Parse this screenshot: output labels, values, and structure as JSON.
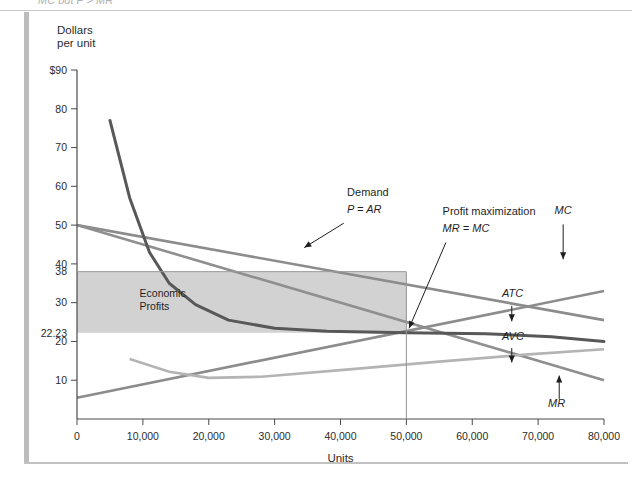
{
  "page": {
    "clipped_header_text": "MC but P > MR"
  },
  "chart_data": {
    "type": "line",
    "title": "",
    "ylabel_line1": "Dollars",
    "ylabel_line2": "per unit",
    "xlabel": "Units",
    "xlim": [
      0,
      80000
    ],
    "ylim": [
      0,
      90
    ],
    "grid": false,
    "legend_position": "inline-annotations",
    "x_ticks": [
      "0",
      "10,000",
      "20,000",
      "30,000",
      "40,000",
      "50,000",
      "60,000",
      "70,000",
      "80,000"
    ],
    "x_tick_values": [
      0,
      10000,
      20000,
      30000,
      40000,
      50000,
      60000,
      70000,
      80000
    ],
    "y_ticks": [
      "$90",
      "80",
      "70",
      "60",
      "50",
      "40",
      "38",
      "30",
      "22.23",
      "20",
      "10"
    ],
    "y_tick_values": [
      90,
      80,
      70,
      60,
      50,
      40,
      38,
      30,
      22.23,
      20,
      10
    ],
    "series": [
      {
        "name": "Demand (P = AR)",
        "label": "Demand",
        "label2": "P = AR",
        "color": "#8c8c8c",
        "points": [
          [
            0,
            50
          ],
          [
            80000,
            25.5
          ]
        ]
      },
      {
        "name": "MR",
        "label": "MR",
        "color": "#8f8f8f",
        "points": [
          [
            0,
            50
          ],
          [
            80000,
            10
          ]
        ]
      },
      {
        "name": "ATC",
        "label": "ATC",
        "color": "#585858",
        "points": [
          [
            5000,
            77
          ],
          [
            8000,
            57
          ],
          [
            11000,
            43
          ],
          [
            14000,
            35
          ],
          [
            18000,
            29.5
          ],
          [
            23000,
            25.5
          ],
          [
            30000,
            23.4
          ],
          [
            38000,
            22.6
          ],
          [
            50000,
            22.23
          ],
          [
            62000,
            22.0
          ],
          [
            72000,
            21.2
          ],
          [
            80000,
            20.0
          ]
        ]
      },
      {
        "name": "MC",
        "label": "MC",
        "color": "#8c8c8c",
        "points": [
          [
            0,
            5.5
          ],
          [
            80000,
            33
          ]
        ]
      },
      {
        "name": "AVC",
        "label": "AVC",
        "color": "#b4b4b4",
        "points": [
          [
            8000,
            15.5
          ],
          [
            14000,
            12.2
          ],
          [
            20000,
            10.6
          ],
          [
            28000,
            10.9
          ],
          [
            40000,
            12.6
          ],
          [
            55000,
            14.8
          ],
          [
            68000,
            16.6
          ],
          [
            80000,
            18.0
          ]
        ]
      }
    ],
    "shaded_region": {
      "label_line1": "Economic",
      "label_line2": "Profits",
      "x_from": 0,
      "x_to": 50000,
      "y_from": 22.23,
      "y_to": 38,
      "color": "#d2d2d2"
    },
    "annotations": [
      {
        "name": "profit-maximization",
        "line1": "Profit maximization",
        "line2": "MR = MC",
        "target_x": 50000,
        "target_y": 22.23
      }
    ],
    "markers": {
      "equilibrium_x": 50000,
      "equilibrium_price": 38,
      "equilibrium_atc": 22.23
    }
  }
}
